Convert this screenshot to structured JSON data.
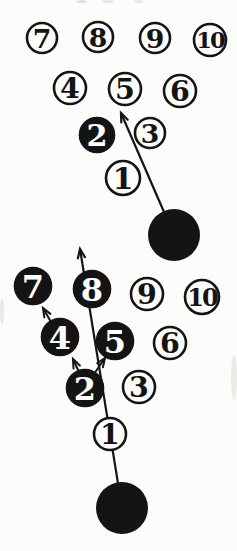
{
  "colors": {
    "ink": "#141414",
    "paper": "#fcfcfa",
    "pin_fill_open": "#fcfcfa",
    "pin_number_on_filled": "#ffffff"
  },
  "diagrams": [
    {
      "id": "top",
      "pins": [
        {
          "label": "7",
          "x": 42,
          "y": 38,
          "r": 15,
          "filled": false
        },
        {
          "label": "8",
          "x": 98,
          "y": 37,
          "r": 15,
          "filled": false
        },
        {
          "label": "9",
          "x": 155,
          "y": 38,
          "r": 15,
          "filled": false
        },
        {
          "label": "10",
          "x": 210,
          "y": 40,
          "r": 16,
          "filled": false
        },
        {
          "label": "4",
          "x": 70,
          "y": 88,
          "r": 16,
          "filled": false
        },
        {
          "label": "5",
          "x": 125,
          "y": 89,
          "r": 16,
          "filled": false
        },
        {
          "label": "6",
          "x": 180,
          "y": 91,
          "r": 16,
          "filled": false
        },
        {
          "label": "2",
          "x": 97,
          "y": 135,
          "r": 17,
          "filled": true
        },
        {
          "label": "3",
          "x": 150,
          "y": 133,
          "r": 15,
          "filled": false
        },
        {
          "label": "1",
          "x": 123,
          "y": 178,
          "r": 17,
          "filled": false
        }
      ],
      "ball": {
        "x": 174,
        "y": 235,
        "r": 26
      },
      "ball_path": {
        "from": [
          174,
          235
        ],
        "tip": [
          121,
          113
        ]
      },
      "deflections": []
    },
    {
      "id": "bottom",
      "pins": [
        {
          "label": "7",
          "x": 33,
          "y": 286,
          "r": 18,
          "filled": true
        },
        {
          "label": "8",
          "x": 92,
          "y": 289,
          "r": 18,
          "filled": true
        },
        {
          "label": "9",
          "x": 147,
          "y": 294,
          "r": 16,
          "filled": false
        },
        {
          "label": "10",
          "x": 202,
          "y": 297,
          "r": 17,
          "filled": false
        },
        {
          "label": "4",
          "x": 60,
          "y": 337,
          "r": 18,
          "filled": true
        },
        {
          "label": "5",
          "x": 115,
          "y": 341,
          "r": 18,
          "filled": true
        },
        {
          "label": "6",
          "x": 170,
          "y": 343,
          "r": 16,
          "filled": false
        },
        {
          "label": "2",
          "x": 85,
          "y": 388,
          "r": 18,
          "filled": true
        },
        {
          "label": "3",
          "x": 139,
          "y": 387,
          "r": 16,
          "filled": false
        },
        {
          "label": "1",
          "x": 110,
          "y": 434,
          "r": 16,
          "filled": false
        }
      ],
      "ball": {
        "x": 122,
        "y": 508,
        "r": 26
      },
      "ball_path": {
        "from": [
          122,
          508
        ],
        "tip": [
          80,
          249
        ]
      },
      "deflections": [
        {
          "from": [
            51,
            322
          ],
          "tip": [
            43,
            308
          ]
        },
        {
          "from": [
            79,
            372
          ],
          "tip": [
            73,
            359
          ]
        },
        {
          "from": [
            94,
            374
          ],
          "tip": [
            105,
            358
          ]
        }
      ]
    }
  ]
}
